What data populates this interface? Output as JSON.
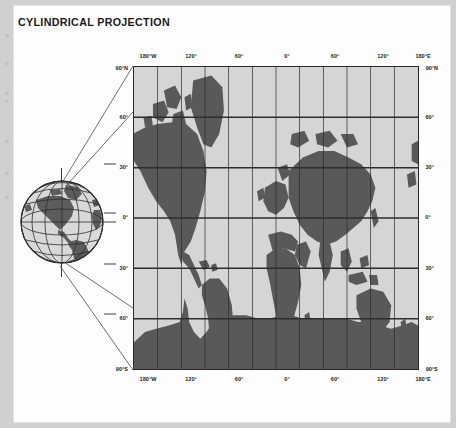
{
  "page": {
    "title": "CYLINDRICAL PROJECTION",
    "background_color": "#cfcfcf",
    "sheet_color": "#fdfdfd"
  },
  "colors": {
    "land": "#595959",
    "ocean": "#d5d5d5",
    "graticule": "#2d2d2d",
    "frame": "#2a2a2a",
    "text": "#1d1d1d",
    "globe_land": "#5c5c5c",
    "globe_ocean": "#d9d9d9",
    "ray": "#4a4a4a"
  },
  "map": {
    "name": "world-cylindrical-projection",
    "projection": "cylindrical",
    "grid": {
      "meridian_interval_deg": 30,
      "parallel_interval_deg": 30,
      "grid_on": true
    },
    "lon_range": [
      -180,
      180
    ],
    "lat_range": [
      -90,
      90
    ],
    "top_labels": [
      "180°W",
      "120°",
      "60°",
      "0°",
      "60°",
      "120°",
      "180°E"
    ],
    "bottom_labels": [
      "180°W",
      "120°",
      "60°",
      "0°",
      "60°",
      "120°",
      "180°E"
    ],
    "left_labels": [
      "90°N",
      "60°",
      "30°",
      "0°",
      "30°",
      "60°",
      "90°S"
    ],
    "right_labels": [
      "90°N",
      "60°",
      "30°",
      "0°",
      "30°",
      "60°",
      "90°S"
    ],
    "lon_label_values": [
      -180,
      -120,
      -60,
      0,
      60,
      120,
      180
    ],
    "lat_label_values": [
      90,
      60,
      30,
      0,
      -30,
      -60,
      -90
    ]
  },
  "globe": {
    "name": "reference-globe",
    "visible_hemisphere": "Americas",
    "has_axis_pin": true,
    "meridian_interval_deg": 30,
    "parallel_interval_deg": 30,
    "tick_labels": [
      "60°",
      "30°",
      "0°",
      "30°",
      "60°"
    ]
  },
  "projection_rays": {
    "name": "projection-construction-lines",
    "count": 4,
    "description": "lines from globe poles to map corners"
  }
}
